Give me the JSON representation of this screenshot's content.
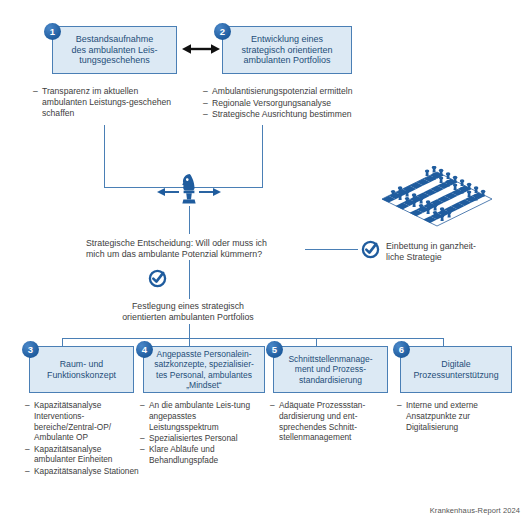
{
  "boxes": [
    {
      "num": "1",
      "title": "Bestandsaufnahme des ambulanten Leis-tungsgeschehens",
      "title_l1": "Bestandsaufnahme",
      "title_l2": "des ambulanten Leis-",
      "title_l3": "tungsgeschehens",
      "bullets": [
        "Transparenz im aktuellen ambulanten Leistungs-geschehen schaffen"
      ]
    },
    {
      "num": "2",
      "title_l1": "Entwicklung eines",
      "title_l2": "strategisch orientierten",
      "title_l3": "ambulanten Portfolios",
      "bullets": [
        "Ambulantisierungspotenzial ermitteln",
        "Regionale Versorgungsanalyse",
        "Strategische Ausrichtung bestimmen"
      ]
    },
    {
      "num": "3",
      "title_l1": "Raum- und",
      "title_l2": "Funktionskonzept",
      "title_l3": "",
      "bullets": [
        "Kapazitätsanalyse Interventions-bereiche/Zentral-OP/ Ambulante OP",
        "Kapazitätsanalyse ambulanter Einheiten",
        "Kapazitätsanalyse Stationen"
      ]
    },
    {
      "num": "4",
      "title_l1": "Angepasste Personalein-",
      "title_l2": "satzkonzepte, spezialisier-",
      "title_l3": "tes Personal, ambulantes",
      "title_l4": "„Mindset“",
      "bullets": [
        "An die ambulante Leis-tung angepasstes Leistungsspektrum",
        "Spezialisiertes Personal",
        "Klare Abläufe und Behandlungspfade"
      ]
    },
    {
      "num": "5",
      "title_l1": "Schnittstellenmanage-",
      "title_l2": "ment und Prozess-",
      "title_l3": "standardisierung",
      "bullets": [
        "Adäquate Prozessstan-dardisierung  und ent-sprechendes Schnitt-stellenmanagement"
      ]
    },
    {
      "num": "6",
      "title_l1": "Digitale",
      "title_l2": "Prozessunterstützung",
      "title_l3": "",
      "bullets": [
        "Interne und externe Ansatzpunkte zur Digitalisierung"
      ]
    }
  ],
  "middle": {
    "decision_l1": "Strategische Entscheidung: Will oder muss ich",
    "decision_l2": "mich um das ambulante Potenzial kümmern?",
    "result_l1": "Festlegung eines strategisch",
    "result_l2": "orientierten ambulanten Portfolios"
  },
  "side_note": {
    "line1": "Einbettung in ganzheit-",
    "line2": "liche Strategie"
  },
  "icons": {
    "knight": "chess-knight-icon",
    "chessboard": "chessboard-icon",
    "check_middle": "check-circle-icon",
    "check_side": "check-circle-icon",
    "double_arrow": "double-arrow-icon"
  },
  "colors": {
    "box_fill": "#dce9f4",
    "box_border": "#4a7fb5",
    "badge": "#1f5c9e",
    "title_text": "#1f4e79",
    "body_text": "#3d3d3d",
    "accent": "#1f5c9e",
    "arrow_black": "#111111"
  },
  "source": "Krankenhaus-Report 2024"
}
